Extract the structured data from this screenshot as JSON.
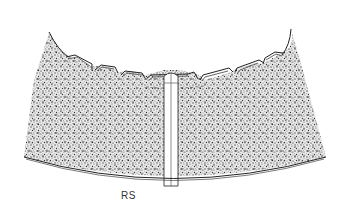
{
  "figure": {
    "label": "RS",
    "colors": {
      "background": "#ffffff",
      "stipple": "#555555",
      "line": "#222222"
    }
  }
}
